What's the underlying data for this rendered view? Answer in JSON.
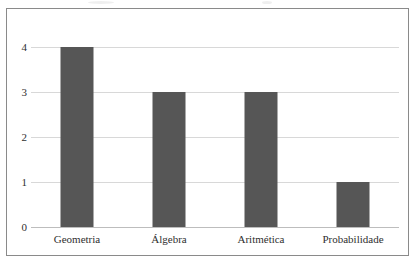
{
  "chart_data": {
    "type": "bar",
    "title": "",
    "subtitle": "",
    "xlabel": "",
    "ylabel": "",
    "categories": [
      "Geometria",
      "Álgebra",
      "Aritmética",
      "Probabilidade"
    ],
    "values": [
      4,
      3,
      3,
      1
    ],
    "series": [
      {
        "name": "",
        "values": [
          4,
          3,
          3,
          1
        ]
      }
    ],
    "ylim": [
      0,
      4
    ],
    "y_ticks": [
      "0",
      "1",
      "2",
      "3",
      "4"
    ],
    "grid": "horizontal",
    "legend": "none",
    "bar_color": "#565656",
    "gridline_color": "#d8d8d8",
    "axis_color": "#bdbdbd",
    "frame_color": "#8a8a8a",
    "background_color": "#ffffff",
    "text_color": "#2f2f2f"
  }
}
